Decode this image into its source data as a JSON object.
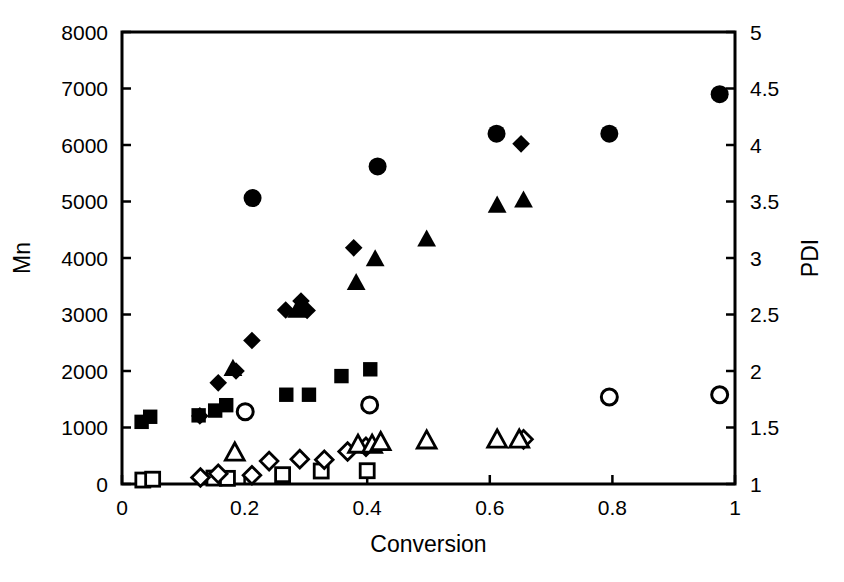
{
  "chart_data": {
    "type": "scatter",
    "title": "",
    "xlabel": "Conversion",
    "ylabel": "Mn",
    "y2label": "PDI",
    "xlim": [
      0,
      1
    ],
    "ylim": [
      0,
      8000
    ],
    "y2lim": [
      1,
      5
    ],
    "grid": false,
    "legend": "none",
    "xticks": [
      "0",
      "0.2",
      "0.4",
      "0.6",
      "0.8",
      "1"
    ],
    "xtick_values": [
      0,
      0.2,
      0.4,
      0.6,
      0.8,
      1
    ],
    "yticks": [
      "0",
      "1000",
      "2000",
      "3000",
      "4000",
      "5000",
      "6000",
      "7000",
      "8000"
    ],
    "ytick_values": [
      0,
      1000,
      2000,
      3000,
      4000,
      5000,
      6000,
      7000,
      8000
    ],
    "y2ticks": [
      "1",
      "1.5",
      "2",
      "2.5",
      "3",
      "3.5",
      "4",
      "4.5",
      "5"
    ],
    "y2tick_values": [
      1,
      1.5,
      2,
      2.5,
      3,
      3.5,
      4,
      4.5,
      5
    ],
    "marker_color": "#000000",
    "series": [
      {
        "name": "Mn series A (filled square)",
        "marker": "filled-square",
        "axis": "left",
        "points": [
          {
            "x": 0.032,
            "y": 1100
          },
          {
            "x": 0.046,
            "y": 1190
          },
          {
            "x": 0.125,
            "y": 1215
          },
          {
            "x": 0.152,
            "y": 1300
          },
          {
            "x": 0.17,
            "y": 1395
          },
          {
            "x": 0.268,
            "y": 1580
          },
          {
            "x": 0.305,
            "y": 1580
          },
          {
            "x": 0.358,
            "y": 1910
          },
          {
            "x": 0.405,
            "y": 2030
          }
        ]
      },
      {
        "name": "Mn series B (filled diamond)",
        "marker": "filled-diamond",
        "axis": "left",
        "points": [
          {
            "x": 0.127,
            "y": 1205
          },
          {
            "x": 0.157,
            "y": 1790
          },
          {
            "x": 0.186,
            "y": 2000
          },
          {
            "x": 0.212,
            "y": 2540
          },
          {
            "x": 0.267,
            "y": 3080
          },
          {
            "x": 0.292,
            "y": 3240
          },
          {
            "x": 0.302,
            "y": 3070
          },
          {
            "x": 0.378,
            "y": 4180
          },
          {
            "x": 0.651,
            "y": 6020
          }
        ]
      },
      {
        "name": "Mn series C (filled triangle)",
        "marker": "filled-triangle",
        "axis": "left",
        "points": [
          {
            "x": 0.181,
            "y": 2050
          },
          {
            "x": 0.285,
            "y": 3080
          },
          {
            "x": 0.382,
            "y": 3570
          },
          {
            "x": 0.413,
            "y": 3990
          },
          {
            "x": 0.497,
            "y": 4340
          },
          {
            "x": 0.612,
            "y": 4940
          },
          {
            "x": 0.655,
            "y": 5030
          }
        ]
      },
      {
        "name": "PDI series A (filled circle)",
        "marker": "filled-circle",
        "axis": "right",
        "points": [
          {
            "x": 0.213,
            "y": 3.53
          },
          {
            "x": 0.417,
            "y": 3.81
          },
          {
            "x": 0.611,
            "y": 4.1
          },
          {
            "x": 0.795,
            "y": 4.1
          },
          {
            "x": 0.975,
            "y": 4.45
          }
        ]
      },
      {
        "name": "PDI series B (open circle)",
        "marker": "open-circle",
        "axis": "right",
        "points": [
          {
            "x": 0.201,
            "y": 1.64
          },
          {
            "x": 0.404,
            "y": 1.7
          },
          {
            "x": 0.795,
            "y": 1.77
          },
          {
            "x": 0.975,
            "y": 1.79
          }
        ]
      },
      {
        "name": "Mn series D (open square)",
        "marker": "open-square",
        "axis": "left",
        "points": [
          {
            "x": 0.034,
            "y": 70
          },
          {
            "x": 0.05,
            "y": 85
          },
          {
            "x": 0.15,
            "y": 105
          },
          {
            "x": 0.172,
            "y": 100
          },
          {
            "x": 0.262,
            "y": 165
          },
          {
            "x": 0.325,
            "y": 230
          },
          {
            "x": 0.4,
            "y": 235
          }
        ]
      },
      {
        "name": "Mn series E (open diamond)",
        "marker": "open-diamond",
        "axis": "left",
        "points": [
          {
            "x": 0.128,
            "y": 115
          },
          {
            "x": 0.157,
            "y": 180
          },
          {
            "x": 0.212,
            "y": 155
          },
          {
            "x": 0.24,
            "y": 405
          },
          {
            "x": 0.29,
            "y": 440
          },
          {
            "x": 0.33,
            "y": 430
          },
          {
            "x": 0.368,
            "y": 575
          },
          {
            "x": 0.398,
            "y": 660
          },
          {
            "x": 0.655,
            "y": 790
          }
        ]
      },
      {
        "name": "Mn series F (open triangle)",
        "marker": "open-triangle",
        "axis": "left",
        "points": [
          {
            "x": 0.184,
            "y": 560
          },
          {
            "x": 0.385,
            "y": 700
          },
          {
            "x": 0.408,
            "y": 700
          },
          {
            "x": 0.422,
            "y": 745
          },
          {
            "x": 0.497,
            "y": 775
          },
          {
            "x": 0.612,
            "y": 790
          },
          {
            "x": 0.648,
            "y": 790
          }
        ]
      }
    ]
  }
}
